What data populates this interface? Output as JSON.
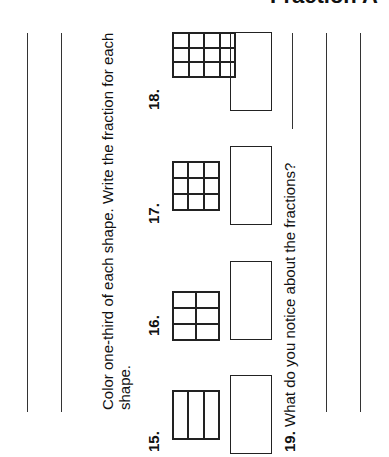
{
  "page": {
    "title": "Fraction A",
    "instruction_line1": "Color one-third of each shape.  Write the fraction for each",
    "instruction_line2": "shape.",
    "problems": [
      {
        "number": "15.",
        "grid": "3 parts (1x3)"
      },
      {
        "number": "16.",
        "grid": "6 parts (2x3)"
      },
      {
        "number": "17.",
        "grid": "9 parts (3x3)"
      },
      {
        "number": "18.",
        "grid": "12 parts (4x3)"
      }
    ],
    "question19_number": "19.",
    "question19_text": " What do you notice about the fractions?"
  }
}
